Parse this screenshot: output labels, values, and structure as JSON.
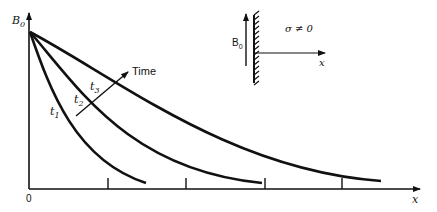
{
  "diagram": {
    "y_axis_label": "B",
    "y_axis_sub": "0",
    "x_axis_label": "x",
    "origin_label": "0",
    "time_arrow_label": "Time",
    "curves": [
      {
        "name": "t1",
        "label": "t",
        "sub": "1"
      },
      {
        "name": "t2",
        "label": "t",
        "sub": "2"
      },
      {
        "name": "t3",
        "label": "t",
        "sub": "3"
      }
    ],
    "inset": {
      "field_label": "B",
      "field_sub": "0",
      "conductivity_label": "σ ≠ 0",
      "x_label": "x"
    }
  },
  "colors": {
    "ink": "#111111",
    "background": "#ffffff"
  }
}
